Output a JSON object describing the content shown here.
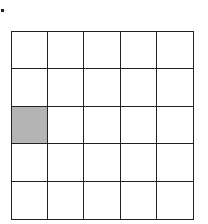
{
  "grid": {
    "rows": 5,
    "cols": 5,
    "shaded_cells": [
      {
        "row": 2,
        "col": 0
      }
    ],
    "line_color": "#222222",
    "shade_color": "#b4b4b4",
    "background_color": "#ffffff"
  }
}
